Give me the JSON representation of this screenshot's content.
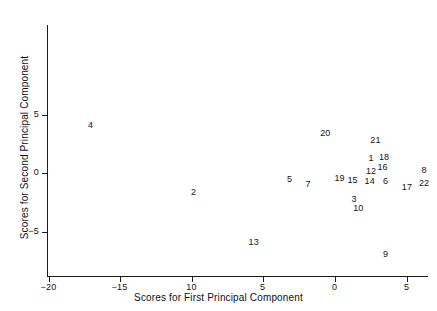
{
  "chart_data": {
    "type": "scatter",
    "title": "",
    "xlabel": "Scores for First Principal Component",
    "ylabel": "Scores for Second Principal Component",
    "xlim": [
      -20.5,
      6.5
    ],
    "ylim": [
      -6.5,
      7.5
    ],
    "grid": false,
    "legend": null,
    "marker_style": "text-label",
    "xticks": [
      -20,
      -15,
      -10,
      -5,
      0,
      5
    ],
    "xtick_labels": [
      "−20",
      "−15",
      "10",
      "5",
      "0",
      "5"
    ],
    "yticks": [
      5,
      0,
      -5
    ],
    "ytick_labels": [
      "5",
      "0",
      "−5"
    ],
    "point_label_field": "label",
    "points": [
      {
        "label": "4",
        "x": -17.0,
        "y": 4.0
      },
      {
        "label": "20",
        "x": -0.6,
        "y": 3.3
      },
      {
        "label": "21",
        "x": 2.9,
        "y": 2.7
      },
      {
        "label": "1",
        "x": 2.6,
        "y": 1.2
      },
      {
        "label": "18",
        "x": 3.5,
        "y": 1.3
      },
      {
        "label": "12",
        "x": 2.6,
        "y": 0.1
      },
      {
        "label": "16",
        "x": 3.4,
        "y": 0.4
      },
      {
        "label": "5",
        "x": -3.1,
        "y": -0.6
      },
      {
        "label": "8",
        "x": 6.3,
        "y": 0.2
      },
      {
        "label": "15",
        "x": 1.3,
        "y": -0.7
      },
      {
        "label": "14",
        "x": 2.5,
        "y": -0.8
      },
      {
        "label": "6",
        "x": 3.6,
        "y": -0.8
      },
      {
        "label": "19",
        "x": 0.4,
        "y": -0.5
      },
      {
        "label": "7",
        "x": -1.8,
        "y": -1.0
      },
      {
        "label": "17",
        "x": 5.1,
        "y": -1.3
      },
      {
        "label": "22",
        "x": 6.3,
        "y": -0.9
      },
      {
        "label": "2",
        "x": -9.8,
        "y": -1.7
      },
      {
        "label": "3",
        "x": 1.4,
        "y": -2.3
      },
      {
        "label": "10",
        "x": 1.7,
        "y": -3.1
      },
      {
        "label": "13",
        "x": -5.6,
        "y": -6.0
      },
      {
        "label": "9",
        "x": 3.6,
        "y": -7.0
      }
    ]
  },
  "axes": {
    "x_title": "Scores for First Principal Component",
    "y_title": "Scores for Second Principal Component"
  },
  "colors": {
    "background": "#ffffff",
    "axis": "#1a1a1a",
    "text": "#111111",
    "point_text": "#141414"
  }
}
